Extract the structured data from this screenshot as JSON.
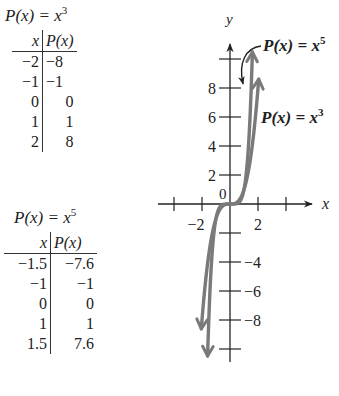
{
  "tables": [
    {
      "title_prefix": "P(x) = x",
      "exponent": "3",
      "headers": [
        "x",
        "P(x)"
      ],
      "rows": [
        [
          "−2",
          "−8"
        ],
        [
          "−1",
          "−1"
        ],
        [
          "0",
          "0"
        ],
        [
          "1",
          "1"
        ],
        [
          "2",
          "8"
        ]
      ]
    },
    {
      "title_prefix": "P(x) = x",
      "exponent": "5",
      "headers": [
        "x",
        "P(x)"
      ],
      "rows": [
        [
          "−1.5",
          "−7.6"
        ],
        [
          "−1",
          "−1"
        ],
        [
          "0",
          "0"
        ],
        [
          "1",
          "1"
        ],
        [
          "1.5",
          "7.6"
        ]
      ]
    }
  ],
  "chart_data": {
    "type": "line",
    "title": "",
    "xlabel": "x",
    "ylabel": "y",
    "xlim": [
      -5,
      6.5
    ],
    "ylim": [
      -11,
      11
    ],
    "x_ticks": [
      -4,
      -2,
      2,
      4
    ],
    "x_tick_labels": [
      {
        "value": -2,
        "label": "−2"
      },
      {
        "value": 2,
        "label": "2"
      }
    ],
    "y_ticks": [
      -10,
      -8,
      -6,
      -4,
      -2,
      2,
      4,
      6,
      8,
      10
    ],
    "y_tick_labels": [
      {
        "value": 8,
        "label": "8"
      },
      {
        "value": 6,
        "label": "6"
      },
      {
        "value": 4,
        "label": "4"
      },
      {
        "value": 2,
        "label": "2"
      },
      {
        "value": -4,
        "label": "−4"
      },
      {
        "value": -6,
        "label": "−6"
      },
      {
        "value": -8,
        "label": "−8"
      }
    ],
    "origin_label": "0",
    "grid": false,
    "series": [
      {
        "name": "P(x) = x^3",
        "label": "P(x) = x",
        "exponent": "3",
        "function": "x^3",
        "x_range": [
          -2.05,
          2.05
        ],
        "points": [
          [
            -2,
            -8
          ],
          [
            -1,
            -1
          ],
          [
            0,
            0
          ],
          [
            1,
            1
          ],
          [
            2,
            8
          ]
        ]
      },
      {
        "name": "P(x) = x^5",
        "label": "P(x) = x",
        "exponent": "5",
        "function": "x^5",
        "x_range": [
          -1.6,
          1.6
        ],
        "points": [
          [
            -1.5,
            -7.6
          ],
          [
            -1,
            -1
          ],
          [
            0,
            0
          ],
          [
            1,
            1
          ],
          [
            1.5,
            7.6
          ]
        ]
      }
    ],
    "curve_color": "#7a7a7a",
    "axis_color": "#222222"
  }
}
